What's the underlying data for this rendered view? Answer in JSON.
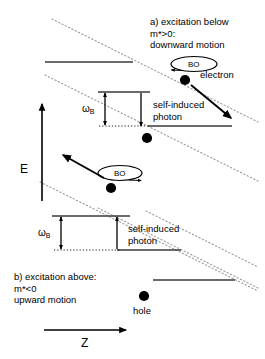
{
  "figure": {
    "title_a_line1": "a) excitation below",
    "title_a_line2": "m*>0:",
    "title_a_line3": "downward motion",
    "title_b_line1": "b) excitation above:",
    "title_b_line2": "m*<0",
    "title_b_line3": "upward motion",
    "axis_energy": "E",
    "axis_position": "Z",
    "label_electron": "electron",
    "label_hole": "hole",
    "label_bo_top": "BO",
    "label_bo_mid": "BO",
    "label_photon_top_line1": "self-induced",
    "label_photon_top_line2": "photon",
    "label_photon_bottom_line1": "self-induced",
    "label_photon_bottom_line2": "photon",
    "label_omega_top": "ω",
    "label_omega_top_sub": "B",
    "label_omega_bottom": "ω",
    "label_omega_bottom_sub": "B",
    "colors": {
      "ink": "#000000",
      "level": "#3a3a3a",
      "band_edge": "#9a9a9a",
      "background": "#ffffff"
    }
  }
}
